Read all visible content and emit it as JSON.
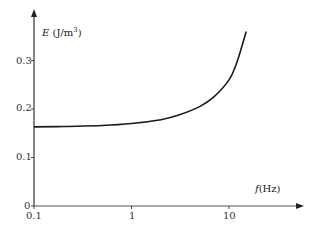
{
  "chart_data": {
    "type": "line",
    "title": "",
    "xlabel": "f (Hz)",
    "xlabel_symbol": "f",
    "xlabel_unit": "(Hz)",
    "ylabel": "E (J/m3)",
    "ylabel_symbol": "E",
    "ylabel_unit": "(J/m",
    "ylabel_unit_sup": "3",
    "ylabel_unit_close": ")",
    "xscale": "log",
    "xlim": [
      0.1,
      30
    ],
    "ylim": [
      0,
      0.37
    ],
    "grid": false,
    "legend": null,
    "x_ticks": [
      "0.1",
      "1",
      "10"
    ],
    "y_ticks": [
      "0",
      "0.1",
      "0.2",
      "0.3"
    ],
    "series": [
      {
        "name": "E(f)",
        "x": [
          0.1,
          0.2,
          0.5,
          1,
          2,
          3,
          5,
          7,
          10,
          12,
          15
        ],
        "y": [
          0.163,
          0.164,
          0.166,
          0.17,
          0.178,
          0.187,
          0.205,
          0.225,
          0.26,
          0.295,
          0.36
        ]
      }
    ]
  }
}
